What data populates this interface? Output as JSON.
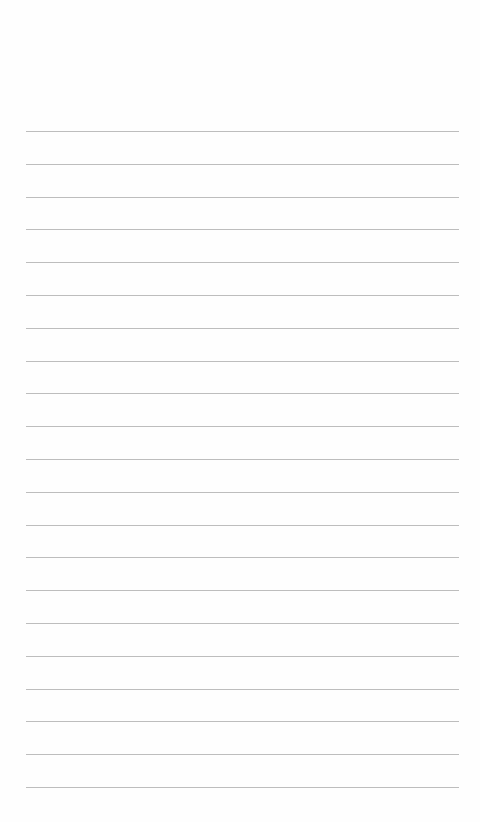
{
  "notepad": {
    "title": "",
    "line_count": 21,
    "first_line_y": 131,
    "line_spacing": 32.8,
    "line_color": "#bdbdbd",
    "background_color": "#fefefe",
    "lines": [
      "",
      "",
      "",
      "",
      "",
      "",
      "",
      "",
      "",
      "",
      "",
      "",
      "",
      "",
      "",
      "",
      "",
      "",
      "",
      "",
      ""
    ]
  }
}
